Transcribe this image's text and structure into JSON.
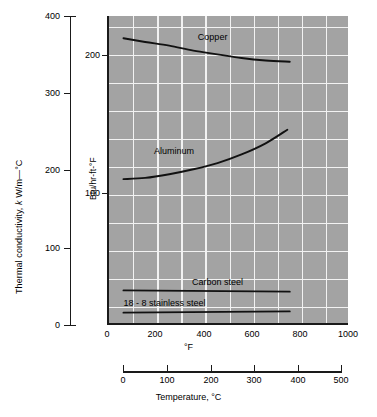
{
  "chart_data": {
    "type": "line",
    "title": "",
    "xlabel": "°F",
    "ylabel": "Btu/hr-ft-°F",
    "secondary_xlabel": "Temperature, °C",
    "secondary_ylabel": "Thermal conductivity, k W/m—°C",
    "xlim": [
      0,
      1000
    ],
    "xticks": [
      0,
      200,
      400,
      600,
      800,
      1000
    ],
    "secondary_xlim": [
      0,
      500
    ],
    "secondary_xticks": [
      0,
      100,
      200,
      300,
      400,
      500
    ],
    "ylim": [
      0,
      250
    ],
    "yticks": [
      100,
      200
    ],
    "secondary_ylim": [
      0,
      400
    ],
    "secondary_yticks": [
      0,
      100,
      200,
      300,
      400
    ],
    "grid": true,
    "grid_color": "#f2f2f2",
    "plot_bg": "#a3a3a3",
    "line_color": "#111111",
    "legend_position": "inline-annotations",
    "series": [
      {
        "name": "Copper",
        "label": "Copper",
        "x": [
          60,
          150,
          250,
          350,
          450,
          550,
          650,
          750
        ],
        "y": [
          232,
          229,
          226,
          222,
          219,
          216,
          214,
          213
        ],
        "label_x": 430,
        "label_y": 232
      },
      {
        "name": "Aluminum",
        "label": "Aluminum",
        "x": [
          60,
          150,
          250,
          350,
          450,
          550,
          650,
          740
        ],
        "y": [
          118,
          119,
          122,
          126,
          131,
          138,
          147,
          158
        ],
        "label_x": 270,
        "label_y": 140
      },
      {
        "name": "Carbon steel",
        "label": "Carbon steel",
        "x": [
          60,
          750
        ],
        "y": [
          28,
          27
        ],
        "label_x": 450,
        "label_y": 34
      },
      {
        "name": "18 - 8 stainless steel",
        "label": "18 - 8 stainless steel",
        "x": [
          60,
          750
        ],
        "y": [
          10,
          11
        ],
        "label_x": 230,
        "label_y": 17
      }
    ]
  },
  "axes": {
    "si_axis": {
      "title_prefix": "Thermal conductivity, ",
      "title_symbol": "k",
      "title_suffix": " W/m—°C",
      "title_full": "Thermal conductivity, k W/m—°C",
      "ticks": [
        "400",
        "300",
        "200",
        "100",
        "0"
      ]
    },
    "btu_axis": {
      "title": "Btu/hr-ft-°F",
      "ticks": [
        "200",
        "100"
      ]
    },
    "f_axis": {
      "title": "°F",
      "ticks": [
        "0",
        "200",
        "400",
        "600",
        "800",
        "1000"
      ]
    },
    "c_axis": {
      "title": "Temperature, °C",
      "ticks": [
        "0",
        "100",
        "200",
        "300",
        "400",
        "500"
      ]
    }
  }
}
